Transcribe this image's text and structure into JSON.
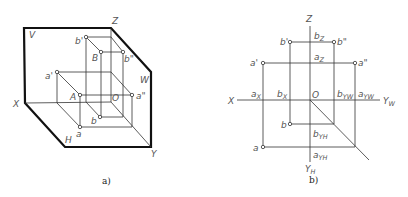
{
  "figure_a": {
    "caption": "a)",
    "planes": {
      "V": "V",
      "H": "H",
      "W": "W"
    },
    "axes": {
      "X": "X",
      "Y": "Y",
      "Z": "Z",
      "O": "O"
    },
    "points": {
      "A": "A",
      "B": "B",
      "a": "a",
      "a_prime": "a'",
      "a_dprime": "a\"",
      "b": "b",
      "b_prime": "b'",
      "b_dprime": "b\""
    }
  },
  "figure_b": {
    "caption": "b)",
    "axes": {
      "X": "X",
      "Z": "Z",
      "O": "O",
      "YW": "Y",
      "YW_sub": "W",
      "YH": "Y",
      "YH_sub": "H"
    },
    "points": {
      "a": "a",
      "a_prime": "a'",
      "a_dprime": "a\"",
      "b": "b",
      "b_prime": "b'",
      "b_dprime": "b\""
    },
    "axis_marks": {
      "aX": "a",
      "aX_sub": "X",
      "bX": "b",
      "bX_sub": "X",
      "aZ": "a",
      "aZ_sub": "Z",
      "bZ": "b",
      "bZ_sub": "Z",
      "aYW": "a",
      "aYW_sub": "YW",
      "bYW": "b",
      "bYW_sub": "YW",
      "aYH": "a",
      "aYH_sub": "YH",
      "bYH": "b",
      "bYH_sub": "YH"
    }
  }
}
